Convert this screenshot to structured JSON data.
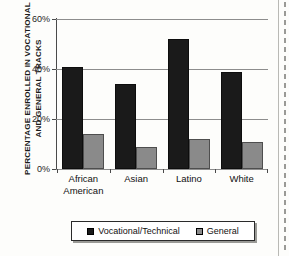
{
  "chart_data": {
    "type": "bar",
    "title": "",
    "xlabel": "",
    "ylabel": "PERCENTAGE ENROLLED IN VOCATIONAL AND GENERAL TRACKS",
    "ylabel_lines": [
      "PERCENTAGE ENROLLED IN VOCATIONAL",
      "AND GENERAL TRACKS"
    ],
    "categories": [
      "African American",
      "Asian",
      "Latino",
      "White"
    ],
    "category_lines": [
      [
        "African",
        "American"
      ],
      [
        "Asian"
      ],
      [
        "Latino"
      ],
      [
        "White"
      ]
    ],
    "series": [
      {
        "name": "Vocational/Technical",
        "values": [
          41,
          34,
          52,
          39
        ],
        "color": "#1a1a1a"
      },
      {
        "name": "General",
        "values": [
          14,
          9,
          12,
          11
        ],
        "color": "#8a8a8a"
      }
    ],
    "ylim": [
      0,
      60
    ],
    "y_ticks": [
      0,
      20,
      40,
      60
    ],
    "y_tick_labels": [
      "0%",
      "20%",
      "40%",
      "60%"
    ],
    "grid": true,
    "legend_position": "bottom"
  },
  "legend": {
    "entries": [
      {
        "label": "Vocational/Technical",
        "swatch": "black-square-swatch"
      },
      {
        "label": "General",
        "swatch": "gray-square-swatch"
      }
    ]
  }
}
